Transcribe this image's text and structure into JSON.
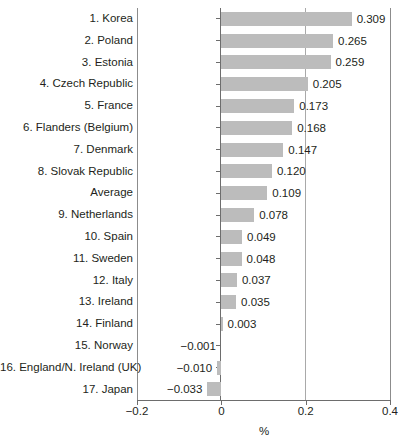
{
  "chart_data": {
    "type": "bar",
    "orientation": "horizontal",
    "title": "",
    "subtitle": "",
    "xlabel": "%",
    "ylabel": "",
    "xlim": [
      -0.2,
      0.4
    ],
    "xticks": [
      -0.2,
      0,
      0.2,
      0.4
    ],
    "xticklabels": [
      "−0.2",
      "0",
      "0.2",
      "0.4"
    ],
    "grid": true,
    "gridlines_at": [
      -0.2,
      0,
      0.2,
      0.4
    ],
    "legend": null,
    "bar_color": "#bcbcbc",
    "categories": [
      "1. Korea",
      "2. Poland",
      "3. Estonia",
      "4. Czech Republic",
      "5. France",
      "6. Flanders (Belgium)",
      "7. Denmark",
      "8. Slovak Republic",
      "Average",
      "9. Netherlands",
      "10. Spain",
      "11. Sweden",
      "12. Italy",
      "13. Ireland",
      "14. Finland",
      "15. Norway",
      "16. England/N. Ireland (UK)",
      "17. Japan"
    ],
    "values": [
      0.309,
      0.265,
      0.259,
      0.205,
      0.173,
      0.168,
      0.147,
      0.12,
      0.109,
      0.078,
      0.049,
      0.048,
      0.037,
      0.035,
      0.003,
      -0.001,
      -0.01,
      -0.033
    ],
    "value_labels": [
      "0.309",
      "0.265",
      "0.259",
      "0.205",
      "0.173",
      "0.168",
      "0.147",
      "0.120",
      "0.109",
      "0.078",
      "0.049",
      "0.048",
      "0.037",
      "0.035",
      "0.003",
      "−0.001",
      "−0.010",
      "−0.033"
    ]
  }
}
